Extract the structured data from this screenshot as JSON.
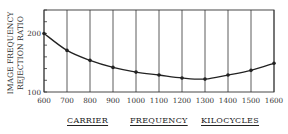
{
  "chart_data": {
    "type": "line",
    "title": "",
    "xlabel": "CARRIER FREQUENCY KILOCYCLES",
    "xlabel_parts": [
      "CARRIER",
      "FREQUENCY",
      "KILOCYCLES"
    ],
    "ylabel": "IMAGE FREQUENCY REJECTION RATIO",
    "ylabel_lines": [
      "IMAGE FREQUENCY",
      "REJECTION RATIO"
    ],
    "x": [
      600,
      700,
      800,
      900,
      1000,
      1100,
      1200,
      1300,
      1400,
      1500,
      1600
    ],
    "series": [
      {
        "name": "Image frequency rejection ratio",
        "values": [
          200,
          171,
          154,
          142,
          134,
          129,
          124,
          122,
          129,
          137,
          149
        ]
      }
    ],
    "x_ticks": [
      "600",
      "700",
      "800",
      "900",
      "1000",
      "1100",
      "1200",
      "1300",
      "1400",
      "1500",
      "1600"
    ],
    "y_tick_labels": [
      "100",
      "200"
    ],
    "xlim": [
      600,
      1600
    ],
    "ylim": [
      100,
      240
    ],
    "y_minor_tick_step": 20,
    "grid": "vertical lines at each x tick",
    "legend": "none",
    "markers": "filled dots at each data point",
    "colors": {
      "line": "#222222",
      "grid": "#333333",
      "background": "#ffffff"
    }
  }
}
